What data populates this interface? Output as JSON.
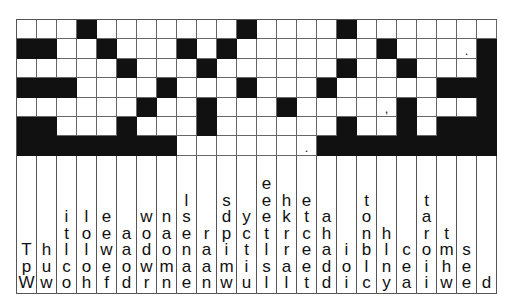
{
  "puzzle": {
    "type": "drop-quote",
    "cols": 24,
    "rows": 7,
    "grid": [
      [
        "",
        "",
        "",
        "#",
        "",
        "",
        "",
        "",
        "",
        "",
        "",
        "#",
        "",
        "",
        "",
        "",
        "#",
        "",
        "",
        "",
        "",
        "",
        "",
        ""
      ],
      [
        "#",
        "#",
        "",
        "",
        "#",
        "",
        "",
        "",
        "#",
        "",
        "#",
        "",
        "",
        "",
        "",
        "",
        "",
        "",
        "#",
        "",
        "",
        "",
        ".",
        "#"
      ],
      [
        "",
        "",
        "",
        "",
        "",
        "#",
        "",
        "",
        "",
        "#",
        "",
        "",
        "",
        "",
        "",
        "",
        "#",
        "",
        "",
        "#",
        "",
        "",
        "",
        "#"
      ],
      [
        "#",
        "#",
        "#",
        "",
        "",
        "",
        "",
        "#",
        "",
        "",
        "",
        "#",
        "",
        "",
        "",
        "#",
        "",
        "",
        "",
        "",
        "",
        "#",
        "#",
        "#"
      ],
      [
        "",
        "",
        "",
        "",
        "",
        "",
        "#",
        "",
        "",
        "#",
        "",
        "",
        "",
        "#",
        "",
        "",
        "",
        "",
        ",",
        "#",
        "",
        "",
        "",
        "#"
      ],
      [
        "#",
        "#",
        "",
        "",
        "",
        "#",
        "",
        "",
        "",
        "#",
        "",
        "",
        "",
        "",
        "",
        "",
        "#",
        "",
        "",
        "#",
        "",
        "#",
        "#",
        "#"
      ],
      [
        "#",
        "#",
        "#",
        "#",
        "#",
        "#",
        "#",
        "#",
        "",
        "",
        "",
        "",
        "",
        "",
        ".",
        "#",
        "#",
        "#",
        "#",
        "#",
        "#",
        "#",
        "#",
        "#"
      ]
    ],
    "letter_columns": [
      [
        "T",
        "p",
        "W"
      ],
      [
        "h",
        "u",
        "w"
      ],
      [
        "i",
        "t",
        "l",
        "c",
        "o"
      ],
      [
        "l",
        "o",
        "l",
        "o",
        "h"
      ],
      [
        "e",
        "e",
        "w",
        "e",
        "f"
      ],
      [
        "a",
        "a",
        "o",
        "d"
      ],
      [
        "w",
        "o",
        "d",
        "w",
        "r"
      ],
      [
        "n",
        "a",
        "o",
        "m",
        "n"
      ],
      [
        "l",
        "s",
        "e",
        "n",
        "a",
        "e"
      ],
      [
        "r",
        "a",
        "a",
        "n"
      ],
      [
        "s",
        "d",
        "p",
        "i",
        "m",
        "w"
      ],
      [
        "y",
        "c",
        "t",
        "i",
        "u"
      ],
      [
        "e",
        "e",
        "e",
        "t",
        "l",
        "s",
        "l"
      ],
      [
        "h",
        "k",
        "r",
        "r",
        "a",
        "l"
      ],
      [
        "e",
        "t",
        "c",
        "e",
        "e",
        "t"
      ],
      [
        "a",
        "h",
        "a",
        "d",
        "d"
      ],
      [
        "i",
        "o",
        "i"
      ],
      [
        "t",
        "o",
        "n",
        "b",
        "l",
        "c"
      ],
      [
        "h",
        "l",
        "n",
        "y"
      ],
      [
        "c",
        "e",
        "a"
      ],
      [
        "t",
        "a",
        "r",
        "o",
        "i",
        "i"
      ],
      [
        "t",
        "m",
        "h",
        "w"
      ],
      [
        "s",
        "e",
        "e"
      ],
      [
        "d"
      ]
    ]
  },
  "colors": {
    "black_cell": "#111111",
    "white_cell": "#ffffff",
    "grid_line": "#666666"
  }
}
